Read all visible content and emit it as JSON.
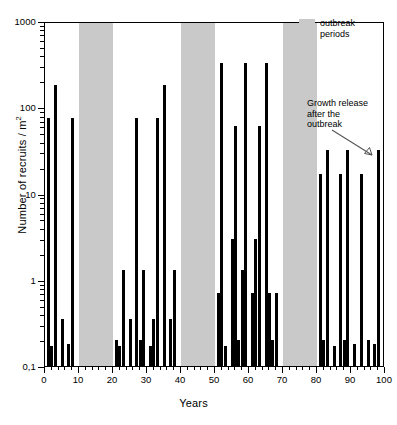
{
  "chart_data": {
    "type": "bar",
    "title": "",
    "xlabel": "Years",
    "ylabel": "Number of recruits / m²",
    "ylabel_unit_sup": "2",
    "yscale": "log",
    "ylim": [
      0.1,
      1000
    ],
    "xlim": [
      0,
      100
    ],
    "ytick_labels": [
      "1000",
      "100",
      "10",
      "1",
      "0,1"
    ],
    "ytick_values": [
      1000,
      100,
      10,
      1,
      0.1
    ],
    "xtick_labels": [
      "0",
      "10",
      "20",
      "30",
      "40",
      "50",
      "60",
      "70",
      "80",
      "90",
      "100"
    ],
    "xtick_values": [
      0,
      10,
      20,
      30,
      40,
      50,
      60,
      70,
      80,
      90,
      100
    ],
    "grid": false,
    "bar_color": "#000000",
    "band_color": "#c9c9c9",
    "x": [
      1,
      2,
      3,
      5,
      7,
      8,
      21,
      22,
      23,
      25,
      27,
      28,
      29,
      31,
      32,
      33,
      35,
      37,
      38,
      51,
      52,
      53,
      55,
      56,
      57,
      58,
      59,
      61,
      62,
      63,
      65,
      66,
      67,
      68,
      81,
      82,
      83,
      85,
      87,
      88,
      89,
      91,
      93,
      95,
      97,
      98
    ],
    "values": [
      75,
      0.17,
      180,
      0.35,
      0.18,
      75,
      0.2,
      0.17,
      1.3,
      0.35,
      75,
      0.2,
      1.3,
      0.17,
      0.35,
      75,
      180,
      0.35,
      1.3,
      0.7,
      330,
      0.17,
      3.0,
      60,
      0.2,
      1.3,
      330,
      0.7,
      3.0,
      60,
      330,
      0.7,
      0.2,
      0.7,
      17,
      0.2,
      32,
      0.17,
      17,
      0.2,
      32,
      0.18,
      17,
      0.2,
      0.18,
      32
    ],
    "outbreak_bands": [
      {
        "start": 10,
        "end": 20
      },
      {
        "start": 40,
        "end": 50
      },
      {
        "start": 70,
        "end": 80
      }
    ],
    "legend": {
      "position": "top-right",
      "entries": [
        {
          "label": "outbreak\nperiods",
          "color": "#c9c9c9",
          "type": "patch"
        }
      ]
    },
    "annotations": [
      {
        "text": "Growth release\nafter the\noutbreak",
        "x": 94,
        "y": 45,
        "arrow": true
      }
    ]
  },
  "axes": {
    "y_title_main": "Number of recruits / m",
    "y_title_sup": "2",
    "x_title": "Years"
  },
  "legend": {
    "line1": "outbreak",
    "line2": "periods"
  },
  "annotation": {
    "line1": "Growth release",
    "line2": "after the",
    "line3": "outbreak"
  }
}
